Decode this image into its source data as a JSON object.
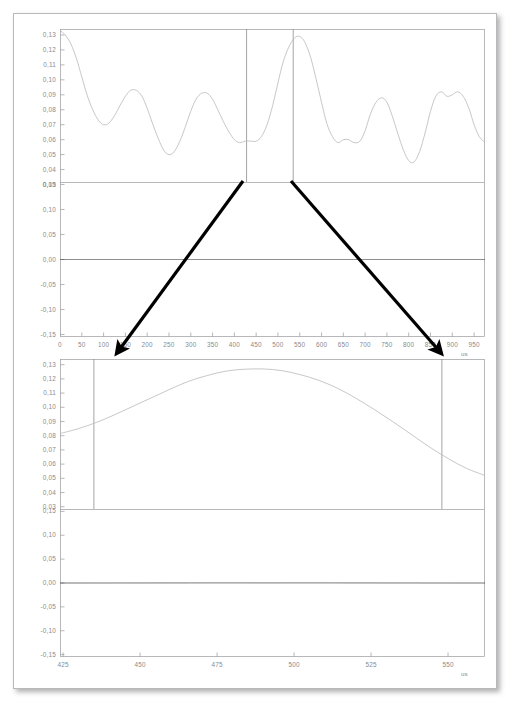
{
  "document": {
    "title": "Signal envelope and waveform zoom analysis",
    "background": "#ffffff",
    "frame_color": "#b9b9bb"
  },
  "colors": {
    "trace": "#b9b9bc",
    "dense_trace": "#4a4a4a",
    "axis": "#9a9a9e",
    "tick_text": "#8a8a8e",
    "cursor": "#8d8d92",
    "arrow": "#000000"
  },
  "annotations": {
    "arrows": [
      {
        "name": "zoom-arrow-left",
        "x1": 243,
        "y1": 181,
        "x2": 117,
        "y2": 353
      },
      {
        "name": "zoom-arrow-right",
        "x1": 291,
        "y1": 181,
        "x2": 441,
        "y2": 353
      }
    ]
  },
  "chart_data": [
    {
      "id": "panel-1-envelope-overview",
      "type": "line",
      "title": "",
      "xlabel": "",
      "ylabel": "",
      "xunit": "us",
      "xlim": [
        0,
        975
      ],
      "ylim": [
        0.027,
        0.134
      ],
      "yticks": [
        "0,13",
        "0,12",
        "0,11",
        "0,10",
        "0,09",
        "0,08",
        "0,07",
        "0,06",
        "0,05",
        "0,04",
        "0,03"
      ],
      "ytick_values": [
        0.13,
        0.12,
        0.11,
        0.1,
        0.09,
        0.08,
        0.07,
        0.06,
        0.05,
        0.04,
        0.03
      ],
      "xticks": [],
      "grid": false,
      "cursors": [
        428,
        535
      ],
      "series": [
        {
          "name": "envelope",
          "x": [
            0,
            12,
            25,
            38,
            50,
            62,
            75,
            88,
            100,
            112,
            125,
            138,
            150,
            162,
            175,
            188,
            200,
            212,
            225,
            238,
            250,
            262,
            275,
            288,
            300,
            312,
            325,
            338,
            350,
            362,
            375,
            388,
            400,
            412,
            425,
            438,
            450,
            462,
            475,
            488,
            500,
            512,
            525,
            538,
            550,
            562,
            575,
            588,
            600,
            612,
            625,
            638,
            650,
            662,
            675,
            688,
            700,
            712,
            725,
            738,
            750,
            762,
            775,
            788,
            800,
            812,
            825,
            838,
            850,
            862,
            875,
            888,
            900,
            912,
            925,
            938,
            950,
            962,
            975
          ],
          "y": [
            0.133,
            0.13,
            0.124,
            0.114,
            0.102,
            0.09,
            0.08,
            0.073,
            0.07,
            0.071,
            0.076,
            0.083,
            0.089,
            0.093,
            0.093,
            0.089,
            0.081,
            0.071,
            0.061,
            0.053,
            0.05,
            0.052,
            0.059,
            0.069,
            0.079,
            0.087,
            0.091,
            0.091,
            0.087,
            0.08,
            0.072,
            0.065,
            0.06,
            0.058,
            0.059,
            0.059,
            0.059,
            0.062,
            0.07,
            0.083,
            0.098,
            0.112,
            0.122,
            0.128,
            0.129,
            0.125,
            0.115,
            0.1,
            0.085,
            0.071,
            0.062,
            0.058,
            0.06,
            0.06,
            0.058,
            0.059,
            0.066,
            0.077,
            0.085,
            0.088,
            0.085,
            0.076,
            0.064,
            0.053,
            0.046,
            0.045,
            0.052,
            0.065,
            0.079,
            0.089,
            0.092,
            0.089,
            0.09,
            0.092,
            0.089,
            0.081,
            0.07,
            0.062,
            0.058
          ]
        }
      ]
    },
    {
      "id": "panel-2-waveform-overview",
      "type": "line",
      "title": "",
      "xlabel": "",
      "ylabel": "",
      "xunit": "us",
      "xlim": [
        0,
        975
      ],
      "ylim": [
        -0.155,
        0.155
      ],
      "yticks": [
        "0,15",
        "0,10",
        "0,05",
        "0,00",
        "-0,05",
        "-0,10",
        "-0,15"
      ],
      "ytick_values": [
        0.15,
        0.1,
        0.05,
        0.0,
        -0.05,
        -0.1,
        -0.15
      ],
      "xticks": [
        0,
        50,
        100,
        150,
        200,
        250,
        300,
        350,
        400,
        450,
        500,
        550,
        600,
        650,
        700,
        750,
        800,
        850,
        900,
        950
      ],
      "xtick_labels": [
        "0",
        "50",
        "100",
        "150",
        "200",
        "250",
        "300",
        "350",
        "400",
        "450",
        "500",
        "550",
        "600",
        "650",
        "700",
        "750",
        "800",
        "850",
        "900",
        "950"
      ],
      "grid": false,
      "carrier_frequency_cycles": 300,
      "description": "dense modulated carrier filling envelope of panel 1 scaled to +/-0.15"
    },
    {
      "id": "panel-3-envelope-zoom",
      "type": "line",
      "title": "",
      "xlabel": "",
      "ylabel": "",
      "xunit": "us",
      "xlim": [
        424,
        562
      ],
      "ylim": [
        0.027,
        0.134
      ],
      "yticks": [
        "0,13",
        "0,12",
        "0,11",
        "0,10",
        "0,09",
        "0,08",
        "0,07",
        "0,06",
        "0,05",
        "0,04",
        "0,03"
      ],
      "ytick_values": [
        0.13,
        0.12,
        0.11,
        0.1,
        0.09,
        0.08,
        0.07,
        0.06,
        0.05,
        0.04,
        0.03
      ],
      "xticks": [],
      "grid": false,
      "cursors": [
        435,
        548
      ],
      "series": [
        {
          "name": "envelope-zoom",
          "x": [
            424,
            430,
            436,
            442,
            448,
            454,
            460,
            466,
            472,
            478,
            484,
            490,
            496,
            502,
            508,
            514,
            520,
            526,
            532,
            538,
            544,
            550,
            556,
            562
          ],
          "y": [
            0.0815,
            0.085,
            0.0895,
            0.095,
            0.101,
            0.107,
            0.113,
            0.1185,
            0.1225,
            0.1255,
            0.1268,
            0.127,
            0.1258,
            0.123,
            0.119,
            0.1135,
            0.1065,
            0.0985,
            0.09,
            0.081,
            0.072,
            0.064,
            0.057,
            0.052
          ]
        }
      ]
    },
    {
      "id": "panel-4-waveform-zoom",
      "type": "line",
      "title": "",
      "xlabel": "",
      "ylabel": "",
      "xunit": "us",
      "xlim": [
        424,
        562
      ],
      "ylim": [
        -0.155,
        0.155
      ],
      "yticks": [
        "0,15",
        "0,10",
        "0,05",
        "0,00",
        "-0,05",
        "-0,10",
        "-0,15"
      ],
      "ytick_values": [
        0.15,
        0.1,
        0.05,
        0.0,
        -0.05,
        -0.1,
        -0.15
      ],
      "xticks": [
        425,
        450,
        475,
        500,
        525,
        550
      ],
      "xtick_labels": [
        "425",
        "450",
        "475",
        "500",
        "525",
        "550"
      ],
      "grid": false,
      "carrier_frequency_cycles": 72,
      "description": "resolved carrier oscillation inside zoomed envelope, amplitude follows panel 3 curve"
    }
  ]
}
